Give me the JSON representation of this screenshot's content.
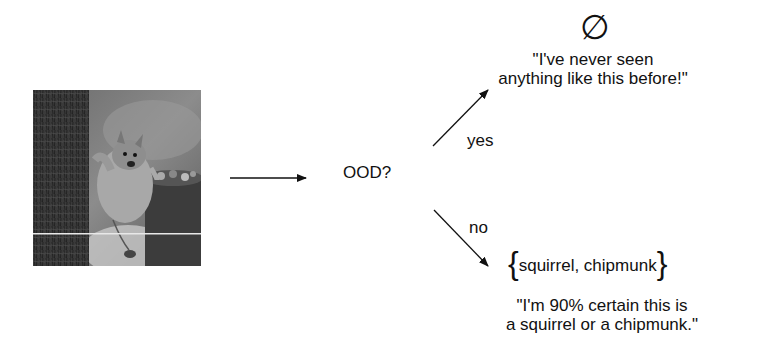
{
  "input": {
    "image_alt": "Photo of a squirrel on a tree trunk next to a bucket",
    "subject": "squirrel"
  },
  "decision": {
    "question": "OOD?"
  },
  "branches": {
    "yes": {
      "label": "yes",
      "symbol": "∅",
      "symbol_name": "empty-set",
      "quote_line1": "\"I've never seen",
      "quote_line2": "anything like this before!\""
    },
    "no": {
      "label": "no",
      "brace_open": "{",
      "set_contents": "squirrel, chipmunk",
      "brace_close": "}",
      "quote_line1": "\"I'm 90% certain this is",
      "quote_line2": "a squirrel or a chipmunk.\""
    }
  },
  "colors": {
    "text": "#111111",
    "arrow": "#111111",
    "background": "#ffffff"
  }
}
